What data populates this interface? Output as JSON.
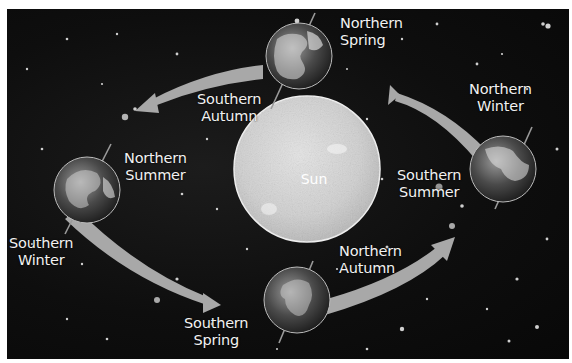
{
  "diagram": {
    "title": "",
    "center": {
      "name": "sun",
      "label": "Sun"
    },
    "positions": [
      {
        "id": "top",
        "northern": "Northern Spring",
        "southern": "Southern Autumn",
        "northern_lines": [
          "Northern",
          "Spring"
        ],
        "southern_lines": [
          "Southern",
          "Autumn"
        ]
      },
      {
        "id": "left",
        "northern": "Northern Summer",
        "southern": "Southern Winter",
        "northern_lines": [
          "Northern",
          "Summer"
        ],
        "southern_lines": [
          "Southern",
          "Winter"
        ]
      },
      {
        "id": "bottom",
        "northern": "Northern Autumn",
        "southern": "Southern Spring",
        "northern_lines": [
          "Northern",
          "Autumn"
        ],
        "southern_lines": [
          "Southern",
          "Spring"
        ]
      },
      {
        "id": "right",
        "northern": "Northern Winter",
        "southern": "Southern Summer",
        "northern_lines": [
          "Northern",
          "Winter"
        ],
        "southern_lines": [
          "Southern",
          "Summer"
        ]
      }
    ],
    "orbit_arrows": [
      {
        "from": "right",
        "to": "top"
      },
      {
        "from": "top",
        "to": "left"
      },
      {
        "from": "left",
        "to": "bottom"
      },
      {
        "from": "bottom",
        "to": "right"
      }
    ],
    "colors": {
      "background": "#0e0e0e",
      "sun": "#d6d6d6",
      "arrow": "#a8a8a8",
      "text": "#f2f2f2"
    }
  }
}
